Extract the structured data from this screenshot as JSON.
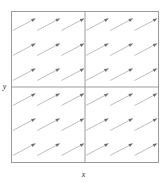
{
  "chart_data": {
    "type": "scatter",
    "subtype": "vector-field",
    "title": "",
    "subtitle": "",
    "xlabel": "x",
    "ylabel": "y",
    "xlim": [
      -3,
      3
    ],
    "ylim": [
      -3,
      3
    ],
    "grid": true,
    "gridlines": {
      "vertical": [
        0
      ],
      "horizontal": [
        0
      ]
    },
    "legend": "none",
    "xticks": [],
    "yticks": [],
    "xticklabels": [],
    "yticklabels": [],
    "arrow_angle_deg": 28,
    "arrow_length_px": 26,
    "arrow_color": "#b4b4b4",
    "arrowhead_color": "#6e6e6e",
    "frame_color": "#9a9a9a",
    "background_color": "#ffffff",
    "columns": 6,
    "rows": 6,
    "x": [
      -2.5,
      -1.5,
      -0.5,
      0.5,
      1.5,
      2.5
    ],
    "y": [
      2.5,
      1.5,
      0.5,
      -0.5,
      -1.5,
      -2.5
    ],
    "series": [
      {
        "name": "u",
        "values": [
          [
            1,
            1,
            1,
            1,
            1,
            1
          ],
          [
            1,
            1,
            1,
            1,
            1,
            1
          ],
          [
            1,
            1,
            1,
            1,
            1,
            1
          ],
          [
            1,
            1,
            1,
            1,
            1,
            1
          ],
          [
            1,
            1,
            1,
            1,
            1,
            1
          ],
          [
            1,
            1,
            1,
            1,
            1,
            1
          ]
        ]
      },
      {
        "name": "v",
        "values": [
          [
            0.53,
            0.53,
            0.53,
            0.53,
            0.53,
            0.53
          ],
          [
            0.53,
            0.53,
            0.53,
            0.53,
            0.53,
            0.53
          ],
          [
            0.53,
            0.53,
            0.53,
            0.53,
            0.53,
            0.53
          ],
          [
            0.53,
            0.53,
            0.53,
            0.53,
            0.53,
            0.53
          ],
          [
            0.53,
            0.53,
            0.53,
            0.53,
            0.53,
            0.53
          ],
          [
            0.53,
            0.53,
            0.53,
            0.53,
            0.53,
            0.53
          ]
        ]
      }
    ]
  }
}
